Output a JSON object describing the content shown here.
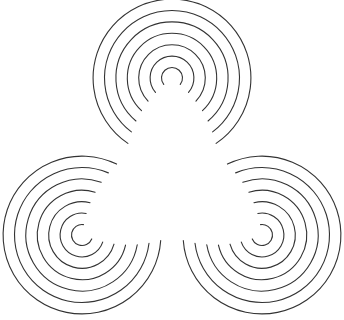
{
  "figure": {
    "type": "line-art-diagram",
    "canvas": {
      "width": 344,
      "height": 320,
      "background_color": "#ffffff"
    },
    "style": {
      "stroke_color": "#333333",
      "stroke_width": 1.1,
      "fill": "none",
      "line_cap": "round"
    },
    "symmetry": {
      "order": 3,
      "type": "rotational",
      "center_x": 172,
      "center_y": 182
    },
    "arc_geometry": {
      "arc_count_per_cluster": 7,
      "radius_min": 10.5,
      "radius_step": 11.4,
      "radii": [
        10.5,
        21.9,
        33.3,
        44.7,
        56.1,
        67.5,
        78.9
      ],
      "sweep_degrees_outer": 292,
      "sweep_degrees_inner": 256,
      "sweep_step_degrees": 6
    },
    "clusters": [
      {
        "name": "top-cluster",
        "label": "Top concentric arc cluster",
        "center_x": 172,
        "center_y": 78,
        "gap_direction_degrees": 90,
        "gap_direction_label": "down",
        "arc_count": 7
      },
      {
        "name": "bottom-left-cluster",
        "label": "Bottom-left concentric arc cluster",
        "center_x": 82,
        "center_y": 235,
        "gap_direction_degrees": 330,
        "gap_direction_label": "upper-right",
        "arc_count": 7
      },
      {
        "name": "bottom-right-cluster",
        "label": "Bottom-right concentric arc cluster",
        "center_x": 262,
        "center_y": 235,
        "gap_direction_degrees": 210,
        "gap_direction_label": "upper-left",
        "arc_count": 7
      }
    ]
  }
}
